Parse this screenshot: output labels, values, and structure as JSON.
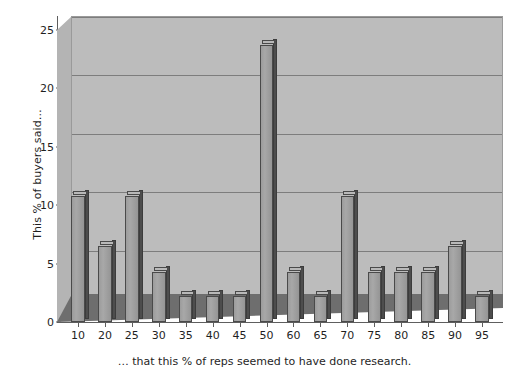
{
  "chart_data": {
    "type": "bar",
    "title": "",
    "xlabel": "… that this % of reps seemed to have done research.",
    "ylabel": "This % of buyers said…",
    "categories": [
      "10",
      "20",
      "25",
      "30",
      "35",
      "40",
      "45",
      "50",
      "60",
      "65",
      "70",
      "75",
      "80",
      "85",
      "90",
      "95"
    ],
    "values": [
      10.8,
      6.5,
      10.8,
      4.3,
      2.2,
      2.2,
      2.2,
      23.7,
      4.3,
      2.2,
      10.8,
      4.3,
      4.3,
      4.3,
      6.5,
      2.2
    ],
    "ylim": [
      0,
      25
    ],
    "y_ticks": [
      0,
      5,
      10,
      15,
      20,
      25
    ],
    "grid": true,
    "legend": false,
    "style": "3d-column",
    "colors": {
      "plot_background": "#bcbcbc",
      "bar_face": "#a0a0a0",
      "bar_side": "#4d4d4d",
      "bar_top": "#b9b9b9",
      "gridline": "#7d7d7d",
      "axis": "#5e5e5e",
      "floor": "#6e6e6e",
      "page_background": "#ffffff",
      "text": "#1f1f1f"
    }
  }
}
